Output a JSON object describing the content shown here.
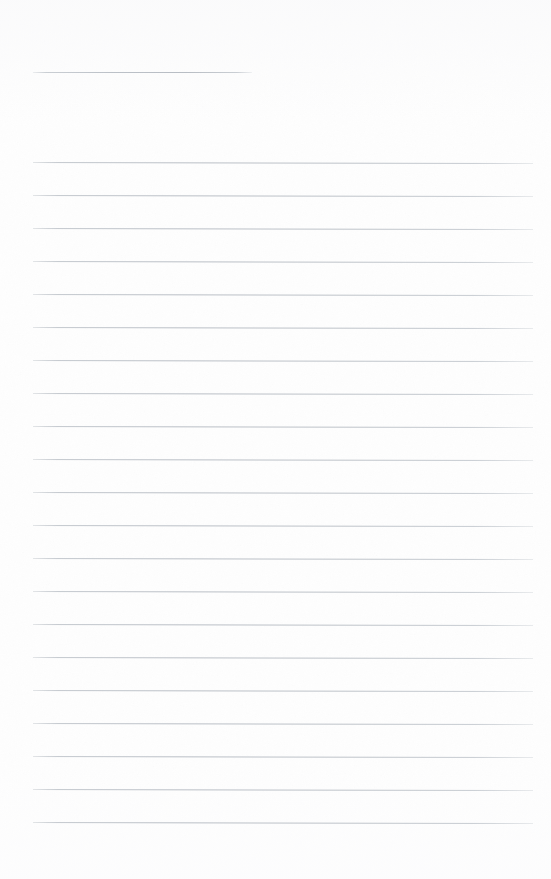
{
  "document": {
    "kind": "blank-ruled-notebook-page",
    "title": "",
    "body_text": "",
    "page_width": 551,
    "page_height": 879,
    "paper_color": "#fefefe",
    "rule_color": "#bcc1c8",
    "rule_thickness": 1
  },
  "layout": {
    "left_margin": 33,
    "right_margin": 18,
    "content_left": 33,
    "content_right": 533,
    "content_width": 500,
    "first_rule_y": 72,
    "body_first_rule_y": 162,
    "rule_spacing": 33,
    "body_rule_count": 21,
    "bottom_blank_height": 57,
    "rule_tilt_px": 1
  },
  "header_rule": {
    "name": "title-rule",
    "x": 33,
    "y": 72,
    "width": 219,
    "label": ""
  },
  "rules": [
    {
      "index": 1,
      "y": 162,
      "x": 33,
      "width": 500,
      "text": ""
    },
    {
      "index": 2,
      "y": 195,
      "x": 33,
      "width": 500,
      "text": ""
    },
    {
      "index": 3,
      "y": 228,
      "x": 33,
      "width": 500,
      "text": ""
    },
    {
      "index": 4,
      "y": 261,
      "x": 33,
      "width": 500,
      "text": ""
    },
    {
      "index": 5,
      "y": 294,
      "x": 33,
      "width": 500,
      "text": ""
    },
    {
      "index": 6,
      "y": 327,
      "x": 33,
      "width": 500,
      "text": ""
    },
    {
      "index": 7,
      "y": 360,
      "x": 33,
      "width": 500,
      "text": ""
    },
    {
      "index": 8,
      "y": 393,
      "x": 33,
      "width": 500,
      "text": ""
    },
    {
      "index": 9,
      "y": 426,
      "x": 33,
      "width": 500,
      "text": ""
    },
    {
      "index": 10,
      "y": 459,
      "x": 33,
      "width": 500,
      "text": ""
    },
    {
      "index": 11,
      "y": 492,
      "x": 33,
      "width": 500,
      "text": ""
    },
    {
      "index": 12,
      "y": 525,
      "x": 33,
      "width": 500,
      "text": ""
    },
    {
      "index": 13,
      "y": 558,
      "x": 33,
      "width": 500,
      "text": ""
    },
    {
      "index": 14,
      "y": 591,
      "x": 33,
      "width": 500,
      "text": ""
    },
    {
      "index": 15,
      "y": 624,
      "x": 33,
      "width": 500,
      "text": ""
    },
    {
      "index": 16,
      "y": 657,
      "x": 33,
      "width": 500,
      "text": ""
    },
    {
      "index": 17,
      "y": 690,
      "x": 33,
      "width": 500,
      "text": ""
    },
    {
      "index": 18,
      "y": 723,
      "x": 33,
      "width": 500,
      "text": ""
    },
    {
      "index": 19,
      "y": 756,
      "x": 33,
      "width": 500,
      "text": ""
    },
    {
      "index": 20,
      "y": 789,
      "x": 33,
      "width": 500,
      "text": ""
    },
    {
      "index": 21,
      "y": 822,
      "x": 33,
      "width": 500,
      "text": ""
    }
  ]
}
